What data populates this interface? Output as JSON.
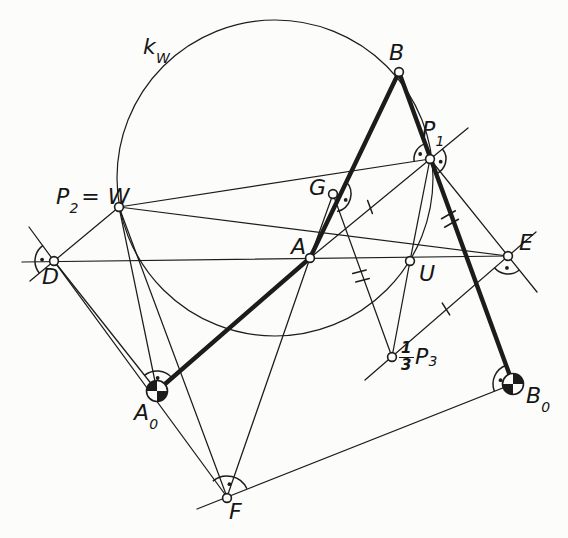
{
  "colors": {
    "ink": "#1c1c1c",
    "paper": "#fcfcfa"
  },
  "labels": {
    "kw": {
      "main": "k",
      "sub": "W"
    },
    "B": {
      "main": "B"
    },
    "P1": {
      "main": "P",
      "sub": "1"
    },
    "P2W": {
      "main": "P",
      "sub": "2",
      "rest": "= W"
    },
    "G": {
      "main": "G"
    },
    "A": {
      "main": "A"
    },
    "U": {
      "main": "U"
    },
    "E": {
      "main": "E"
    },
    "D": {
      "main": "D"
    },
    "A0": {
      "main": "A",
      "sub": "0"
    },
    "B0": {
      "main": "B",
      "sub": "0"
    },
    "F": {
      "main": "F"
    },
    "P3": {
      "frac_num": "1",
      "frac_den": "3",
      "main": "P",
      "sub": "3"
    }
  },
  "diagram": {
    "circle": {
      "name": "pole-circle-kW",
      "cx": 275,
      "cy": 178,
      "r": 158
    },
    "segments": [
      {
        "name": "line-D-E",
        "x1": 22,
        "y1": 262,
        "x2": 508,
        "y2": 256,
        "weight": "thin"
      },
      {
        "name": "line-W-D-extended",
        "x1": 119,
        "y1": 207,
        "x2": 30,
        "y2": 281,
        "weight": "thin"
      },
      {
        "name": "line-F-D-extended",
        "x1": 227,
        "y1": 497,
        "x2": 29,
        "y2": 227,
        "weight": "thin"
      },
      {
        "name": "line-D-A0",
        "x1": 54,
        "y1": 261,
        "x2": 157,
        "y2": 391,
        "weight": "thin"
      },
      {
        "name": "line-W-P1",
        "x1": 119,
        "y1": 207,
        "x2": 430,
        "y2": 159,
        "weight": "thin"
      },
      {
        "name": "line-W-E",
        "x1": 119,
        "y1": 207,
        "x2": 508,
        "y2": 256,
        "weight": "thin"
      },
      {
        "name": "line-W-A0",
        "x1": 119,
        "y1": 207,
        "x2": 157,
        "y2": 391,
        "weight": "thin"
      },
      {
        "name": "line-W-F",
        "x1": 119,
        "y1": 207,
        "x2": 227,
        "y2": 497,
        "weight": "thin"
      },
      {
        "name": "line-A-G",
        "x1": 310,
        "y1": 258,
        "x2": 333,
        "y2": 194,
        "weight": "thin"
      },
      {
        "name": "line-A-P1-extended",
        "x1": 310,
        "y1": 258,
        "x2": 468,
        "y2": 128,
        "weight": "thin"
      },
      {
        "name": "line-A-F",
        "x1": 310,
        "y1": 258,
        "x2": 227,
        "y2": 497,
        "weight": "thin"
      },
      {
        "name": "line-G-P3",
        "x1": 333,
        "y1": 194,
        "x2": 392,
        "y2": 357,
        "weight": "thin"
      },
      {
        "name": "chord-P1-U",
        "x1": 430,
        "y1": 159,
        "x2": 410,
        "y2": 261,
        "weight": "thin"
      },
      {
        "name": "line-P1-E-extended",
        "x1": 430,
        "y1": 159,
        "x2": 537,
        "y2": 292,
        "weight": "thin"
      },
      {
        "name": "line-P3-E-extended",
        "x1": 365,
        "y1": 380,
        "x2": 536,
        "y2": 232,
        "weight": "thin"
      },
      {
        "name": "line-U-P3",
        "x1": 410,
        "y1": 261,
        "x2": 392,
        "y2": 357,
        "weight": "thin"
      },
      {
        "name": "line-F-B0-extended",
        "x1": 197,
        "y1": 509,
        "x2": 513,
        "y2": 384,
        "weight": "thin"
      },
      {
        "name": "link-A0-A",
        "x1": 157,
        "y1": 391,
        "x2": 310,
        "y2": 258,
        "weight": "thick"
      },
      {
        "name": "link-A-B",
        "x1": 310,
        "y1": 258,
        "x2": 399,
        "y2": 72,
        "weight": "thick"
      },
      {
        "name": "link-B-B0",
        "x1": 399,
        "y1": 72,
        "x2": 513,
        "y2": 384,
        "weight": "thick"
      }
    ],
    "ticks": [
      {
        "name": "tick-A-P1",
        "x": 370,
        "y": 207,
        "angle": 70,
        "count": 1,
        "half": 7
      },
      {
        "name": "tick-P3-E",
        "x": 446,
        "y": 309,
        "angle": 58,
        "count": 1,
        "half": 7
      },
      {
        "name": "double-tick-G-P3",
        "x": 361,
        "y": 276,
        "angle": -15,
        "count": 2,
        "half": 7,
        "line_angle": 70
      },
      {
        "name": "double-tick-P1-B0",
        "x": 450,
        "y": 219,
        "angle": -30,
        "count": 2,
        "half": 8,
        "line_angle": 70
      }
    ],
    "angle_arcs": [
      {
        "name": "angle-arc-D",
        "cx": 54,
        "cy": 261,
        "r": 19,
        "a1": 140,
        "a2": 235,
        "dot_a": 187,
        "dot_r": 12
      },
      {
        "name": "angle-arc-A0",
        "cx": 157,
        "cy": 391,
        "r": 20,
        "a1": 231,
        "a2": 319,
        "dot_a": 273,
        "dot_r": 13
      },
      {
        "name": "angle-arc-F",
        "cx": 227,
        "cy": 498,
        "r": 22,
        "a1": 230,
        "a2": 335,
        "dot_a": 280,
        "dot_r": 14
      },
      {
        "name": "angle-arc-B0",
        "cx": 513,
        "cy": 384,
        "r": 20,
        "a1": 159,
        "a2": 250,
        "dot_a": 197,
        "dot_r": 13
      },
      {
        "name": "angle-arc-E",
        "cx": 508,
        "cy": 256,
        "r": 18,
        "a1": 51,
        "a2": 139,
        "dot_a": 95,
        "dot_r": 12
      },
      {
        "name": "angle-arc-G",
        "cx": 333,
        "cy": 194,
        "r": 18,
        "a1": -45,
        "a2": 77,
        "dot_a": 25,
        "dot_r": 14
      },
      {
        "name": "angle-arc-P1-left",
        "cx": 430,
        "cy": 159,
        "r": 16,
        "a1": 171,
        "a2": 251,
        "dot_a": 207,
        "dot_r": 11
      },
      {
        "name": "angle-arc-P1-right",
        "cx": 430,
        "cy": 159,
        "r": 16,
        "a1": -39,
        "a2": 70,
        "dot_a": 14,
        "dot_r": 11
      }
    ],
    "pivots": [
      {
        "name": "pivot-A0",
        "cx": 157,
        "cy": 391,
        "r": 10.5,
        "wedges": [
          [
            180,
            270
          ],
          [
            0,
            90
          ]
        ]
      },
      {
        "name": "pivot-B0",
        "cx": 513,
        "cy": 384,
        "r": 10.5,
        "wedges": [
          [
            270,
            360
          ],
          [
            90,
            180
          ]
        ]
      }
    ],
    "points": [
      {
        "name": "point-B",
        "x": 399,
        "y": 72
      },
      {
        "name": "point-P1",
        "x": 430,
        "y": 159
      },
      {
        "name": "point-W",
        "x": 119,
        "y": 207
      },
      {
        "name": "point-D",
        "x": 54,
        "y": 261
      },
      {
        "name": "point-A",
        "x": 310,
        "y": 258
      },
      {
        "name": "point-G",
        "x": 333,
        "y": 194
      },
      {
        "name": "point-U",
        "x": 410,
        "y": 261
      },
      {
        "name": "point-E",
        "x": 508,
        "y": 256
      },
      {
        "name": "point-P3",
        "x": 392,
        "y": 357
      },
      {
        "name": "point-F",
        "x": 227,
        "y": 498
      }
    ],
    "point_radius": 4.4
  }
}
